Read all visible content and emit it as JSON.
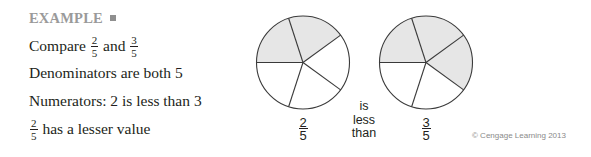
{
  "example": {
    "heading": "EXAMPLE",
    "marker_icon": "square-icon",
    "marker_color": "#8f8f8f",
    "heading_color": "#9a9a9a"
  },
  "steps": {
    "compare": {
      "prefix": "Compare",
      "fraction_a": {
        "numerator": "2",
        "denominator": "5"
      },
      "connector": "and",
      "fraction_b": {
        "numerator": "3",
        "denominator": "5"
      }
    },
    "denominators": "Denominators are both 5",
    "numerators": "Numerators: 2 is less than 3",
    "conclusion": {
      "fraction": {
        "numerator": "2",
        "denominator": "5"
      },
      "text": "has a lesser value"
    }
  },
  "figure": {
    "pies": [
      {
        "label": {
          "numerator": "2",
          "denominator": "5"
        },
        "total_parts": 5,
        "shaded_parts": 2
      },
      {
        "label": {
          "numerator": "3",
          "denominator": "5"
        },
        "total_parts": 5,
        "shaded_parts": 3
      }
    ],
    "comparison_words": [
      "is",
      "less",
      "than"
    ],
    "shade_color": "#e6e6e6",
    "stroke_color": "#3a3a3a"
  },
  "copyright": "© Cengage Learning 2013"
}
